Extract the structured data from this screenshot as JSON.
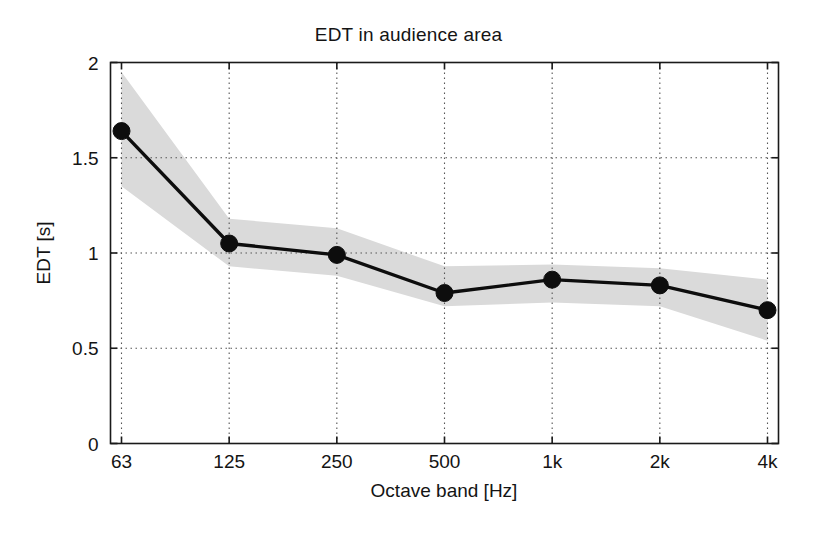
{
  "chart_data": {
    "type": "line",
    "title": "EDT in audience area",
    "xlabel": "Octave band [Hz]",
    "ylabel": "EDT [s]",
    "categories": [
      "63",
      "125",
      "250",
      "500",
      "1k",
      "2k",
      "4k"
    ],
    "values": [
      1.64,
      1.05,
      0.99,
      0.79,
      0.86,
      0.83,
      0.7
    ],
    "band_upper": [
      1.95,
      1.18,
      1.13,
      0.93,
      0.94,
      0.92,
      0.86
    ],
    "band_lower": [
      1.35,
      0.93,
      0.88,
      0.72,
      0.74,
      0.72,
      0.54
    ],
    "ylim": [
      0,
      2
    ],
    "yticks": [
      "0",
      "0.5",
      "1",
      "1.5",
      "2"
    ],
    "ytick_values": [
      0,
      0.5,
      1,
      1.5,
      2
    ],
    "xticks": [
      "63",
      "125",
      "250",
      "500",
      "1k",
      "2k",
      "4k"
    ],
    "grid": true,
    "grid_style": "dotted",
    "legend": null,
    "series": [
      {
        "name": "EDT mean",
        "marker": "filled-circle",
        "color": "#0d0d0d",
        "values": [
          1.64,
          1.05,
          0.99,
          0.79,
          0.86,
          0.83,
          0.7
        ]
      },
      {
        "name": "EDT spread band",
        "type": "area",
        "color": "#d9d9d9",
        "upper": [
          1.95,
          1.18,
          1.13,
          0.93,
          0.94,
          0.92,
          0.86
        ],
        "lower": [
          1.35,
          0.93,
          0.88,
          0.72,
          0.74,
          0.72,
          0.54
        ]
      }
    ]
  }
}
